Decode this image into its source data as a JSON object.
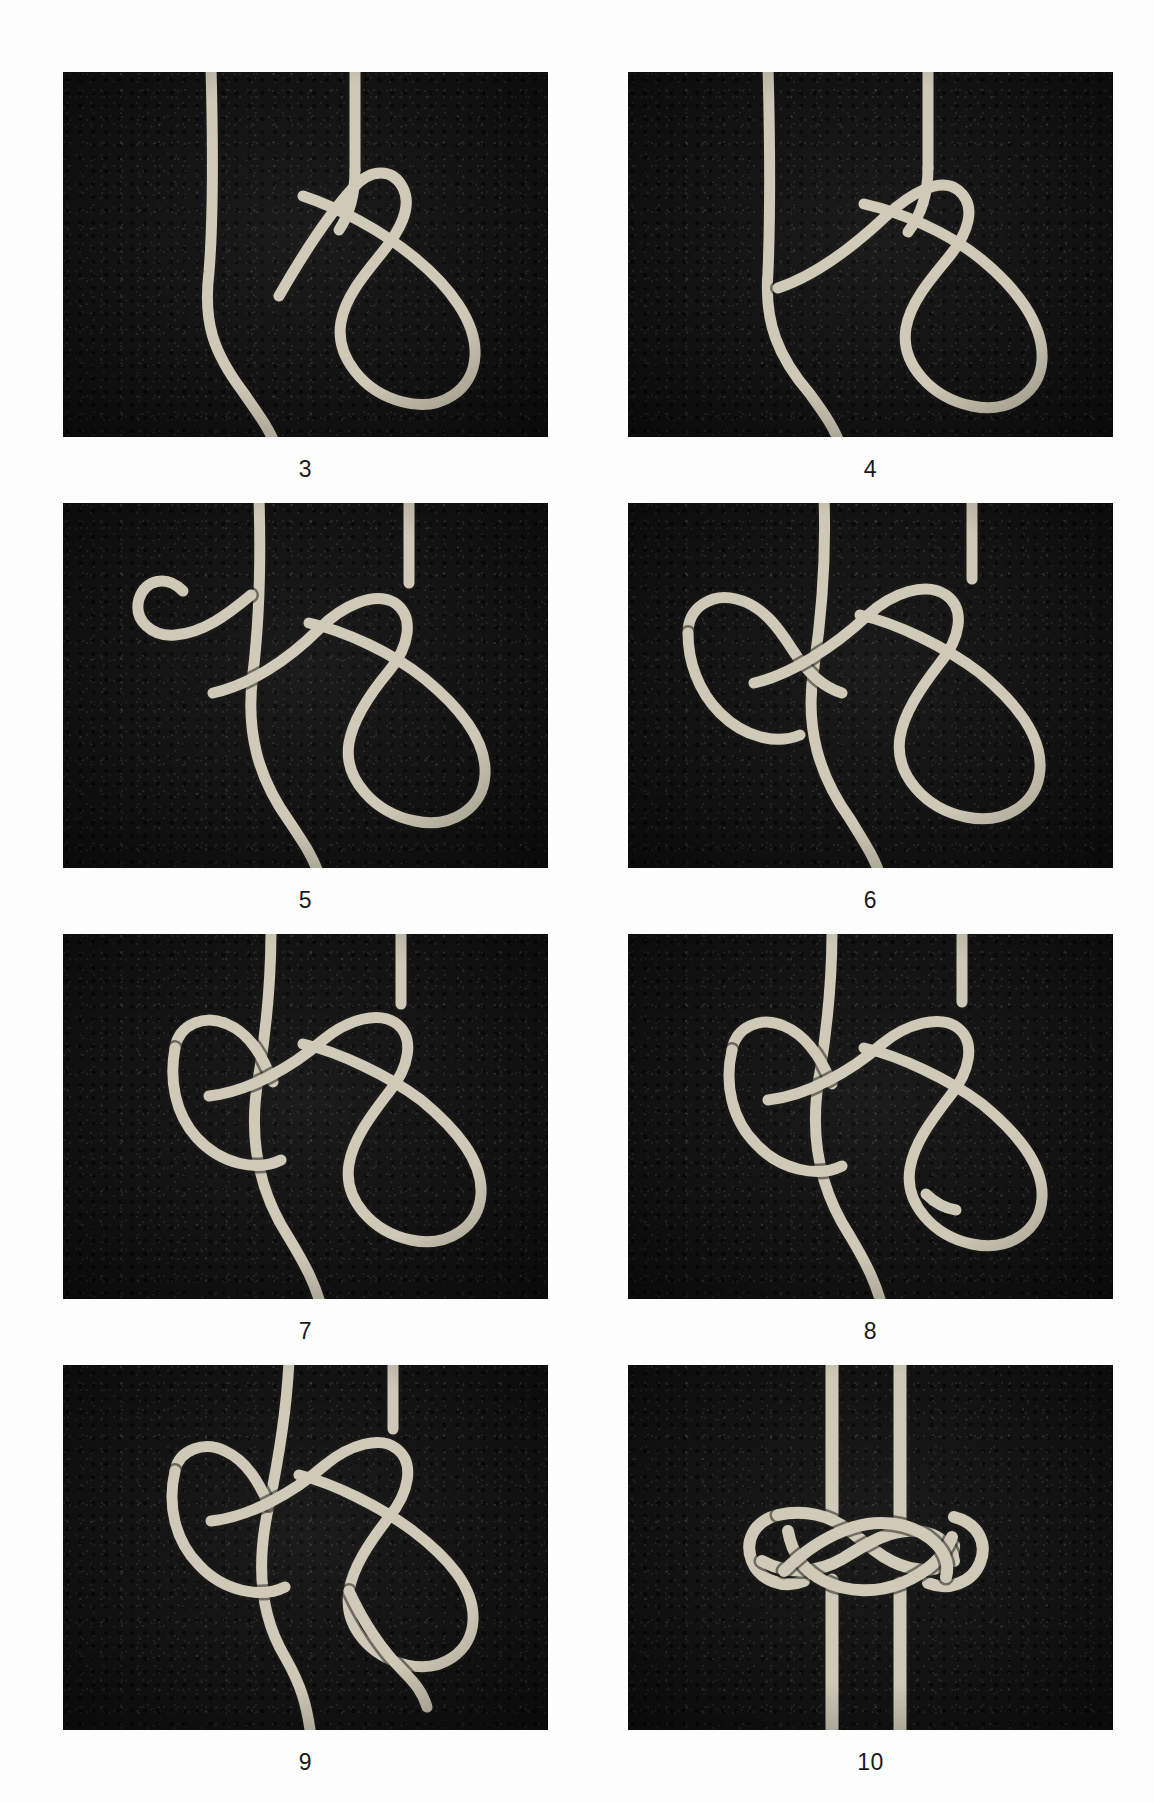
{
  "page": {
    "background_color": "#ffffff",
    "photo_background_color": "#121212",
    "rope_color": "#cfc8b6",
    "caption_color": "#1a1a1a",
    "layout": {
      "columns": 2,
      "rows": 4,
      "photo_width": 485,
      "photo_height": 365
    }
  },
  "figures": [
    {
      "caption": "3",
      "alt": "Rope with a standing line at left, a bight crossing over it and a long loop hanging to the lower right, working end tucked under at the crossing point",
      "position": "row-1-left"
    },
    {
      "caption": "4",
      "alt": "Same arrangement with the working end now passed through the crossing to form a second tuck",
      "position": "row-1-right"
    },
    {
      "caption": "5",
      "alt": "A small open hook-shaped bight added at the upper left above the crossing, long loop still hanging to the lower right",
      "position": "row-2-left"
    },
    {
      "caption": "6",
      "alt": "The left-hand bight is woven under and over the standing parts, forming a lattice on the left side of the knot",
      "position": "row-2-right"
    },
    {
      "caption": "7",
      "alt": "The weave is drawn up tighter; the working end emerges near the centre and the long loop remains at the lower right",
      "position": "row-3-left"
    },
    {
      "caption": "8",
      "alt": "Working end tucked further through the lattice; the knot body is more compact and symmetrical",
      "position": "row-3-right"
    },
    {
      "caption": "9",
      "alt": "Knot nearly complete with the working end exiting at the bottom right and a standing part running down to the lower left",
      "position": "row-4-left"
    },
    {
      "caption": "10",
      "alt": "Finished knot drawn up tight into a flat woven block with two parallel standing ends leaving the top and two leaving the bottom",
      "position": "row-4-right"
    }
  ]
}
